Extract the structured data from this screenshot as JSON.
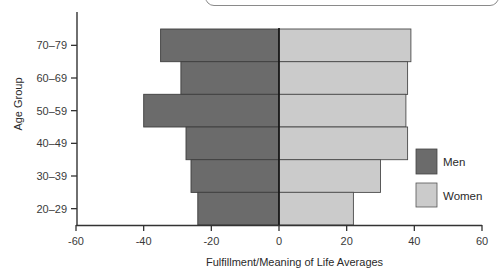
{
  "chart_data": {
    "type": "bar",
    "orientation": "horizontal",
    "layout": "diverging (population-pyramid style)",
    "title": "",
    "xlabel": "Fulfillment/Meaning of Life Averages",
    "ylabel": "Age Group",
    "categories": [
      "70–79",
      "60–69",
      "50–59",
      "40–49",
      "30–39",
      "20–29"
    ],
    "series": [
      {
        "name": "Men",
        "color": "#6b6b6b",
        "values": [
          -35,
          -29,
          -40,
          -27.5,
          -26,
          -24
        ]
      },
      {
        "name": "Women",
        "color": "#cbcbcb",
        "values": [
          39,
          38,
          37.5,
          38,
          30,
          22
        ]
      }
    ],
    "xlim": [
      -60,
      60
    ],
    "xticks": [
      -60,
      -40,
      -20,
      0,
      20,
      40,
      60
    ],
    "xtick_labels": [
      "-60",
      "-40",
      "-20",
      "0",
      "20",
      "40",
      "60"
    ],
    "grid": false,
    "legend": {
      "position": "right, inside lower",
      "entries": [
        "Men",
        "Women"
      ]
    }
  },
  "labels": {
    "xlabel": "Fulfillment/Meaning of Life Averages",
    "ylabel": "Age Group",
    "legend_men": "Men",
    "legend_women": "Women"
  }
}
